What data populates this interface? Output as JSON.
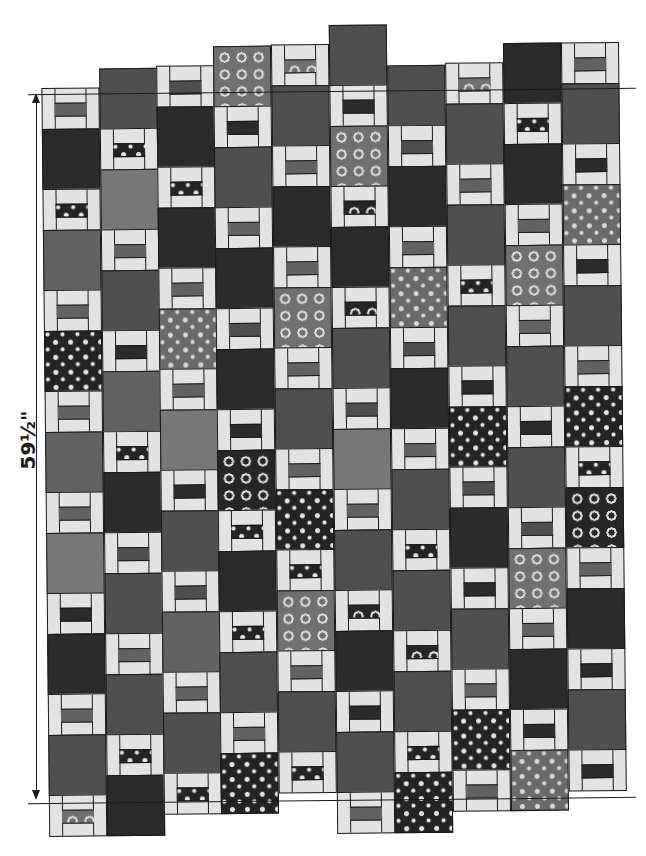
{
  "diagram": {
    "type": "quilt-layout",
    "dimension_label": "59½\"",
    "dimension_orientation": "vertical",
    "block_heights": {
      "square": 61,
      "window": 42
    },
    "column_width": 58,
    "colors": {
      "frame": "#e2e2e2",
      "outline": "#1a1a1a",
      "dark": "#2b2b2b",
      "mid": "#4f4f4f",
      "med": "#626262",
      "light": "#777777"
    },
    "columns": [
      {
        "x": 45,
        "top": 85,
        "blocks": [
          "w:med",
          "sq:dark",
          "w:star-d",
          "sq:med",
          "w:med",
          "sq:star-d",
          "w:med",
          "sq:med",
          "w:med",
          "sq:light",
          "w:dark",
          "sq:dark",
          "w:med",
          "sq:mid",
          "w:circ-l"
        ]
      },
      {
        "x": 103,
        "top": 66,
        "blocks": [
          "sq:mid",
          "w:star-d",
          "sq:light",
          "w:med",
          "sq:mid",
          "w:dark",
          "sq:med",
          "w:star-d",
          "sq:dark",
          "w:mid",
          "sq:mid",
          "w:med",
          "sq:mid",
          "w:star-d",
          "sq:dark"
        ]
      },
      {
        "x": 160,
        "top": 64,
        "blocks": [
          "w:mid",
          "sq:dark",
          "w:star-d",
          "sq:dark",
          "w:med",
          "sq:star-l",
          "w:med",
          "sq:light",
          "w:dark",
          "sq:mid",
          "w:mid",
          "sq:med",
          "w:med",
          "sq:mid",
          "w:star-d"
        ]
      },
      {
        "x": 217,
        "top": 45,
        "blocks": [
          "sq:circ-l",
          "w:dark",
          "sq:mid",
          "w:med",
          "sq:dark",
          "w:mid",
          "sq:dark",
          "w:dark",
          "sq:circ-d",
          "w:star-d",
          "sq:dark",
          "w:star-d",
          "sq:mid",
          "w:med",
          "sq:star-d"
        ]
      },
      {
        "x": 275,
        "top": 44,
        "blocks": [
          "w:circ-l",
          "sq:mid",
          "w:med",
          "sq:dark",
          "w:med",
          "sq:circ-l",
          "w:med",
          "sq:mid",
          "w:med",
          "sq:star-d",
          "w:star-d",
          "sq:circ-l",
          "w:med",
          "sq:mid",
          "w:star-d"
        ]
      },
      {
        "x": 333,
        "top": 25,
        "blocks": [
          "sq:mid",
          "w:dark",
          "sq:circ-l",
          "w:circ-d",
          "sq:dark",
          "w:circ-d",
          "sq:mid",
          "w:mid",
          "sq:light",
          "w:med",
          "sq:mid",
          "w:circ-d",
          "sq:dark",
          "w:dark",
          "sq:mid",
          "w:med"
        ]
      },
      {
        "x": 391,
        "top": 66,
        "blocks": [
          "sq:mid",
          "w:mid",
          "sq:dark",
          "w:med",
          "sq:star-l",
          "w:mid",
          "sq:dark",
          "w:med",
          "sq:mid",
          "w:star-d",
          "sq:mid",
          "w:circ-d",
          "sq:mid",
          "w:star-d",
          "sq:star-d"
        ]
      },
      {
        "x": 449,
        "top": 64,
        "blocks": [
          "w:circ-l",
          "sq:mid",
          "w:med",
          "sq:mid",
          "w:star-d",
          "sq:mid",
          "w:dark",
          "sq:star-d",
          "w:mid",
          "sq:dark",
          "w:dark",
          "sq:mid",
          "w:med",
          "sq:star-d",
          "w:med"
        ]
      },
      {
        "x": 507,
        "top": 45,
        "blocks": [
          "sq:dark",
          "w:star-d",
          "sq:dark",
          "w:med",
          "sq:circ-l",
          "w:med",
          "sq:mid",
          "w:dark",
          "sq:mid",
          "w:mid",
          "sq:circ-l",
          "w:med",
          "sq:dark",
          "w:dark",
          "sq:star-l"
        ]
      },
      {
        "x": 565,
        "top": 45,
        "blocks": [
          "w:med",
          "sq:mid",
          "w:dark",
          "sq:star-l",
          "w:dark",
          "sq:mid",
          "w:med",
          "sq:star-d",
          "w:star-d",
          "sq:circ-d",
          "w:med",
          "sq:dark",
          "w:dark",
          "sq:mid",
          "w:dark"
        ]
      }
    ],
    "guides": {
      "top_line": {
        "x1": 30,
        "x2": 636,
        "y": 90
      },
      "bottom_line": {
        "x1": 30,
        "x2": 636,
        "y": 800
      },
      "dimension_line_x": 36
    }
  }
}
